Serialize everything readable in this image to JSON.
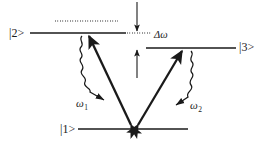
{
  "figure": {
    "kind": "energy-level-diagram",
    "width": 276,
    "height": 142,
    "background_color": "#ffffff",
    "ink_color": "#1a1a1a"
  },
  "levels": [
    {
      "id": "level-2",
      "label": "|2>",
      "label_position": "left",
      "line": {
        "x1": 30,
        "y1": 33,
        "x2": 126,
        "y2": 33
      }
    },
    {
      "id": "level-3",
      "label": "|3>",
      "label_position": "right",
      "line": {
        "x1": 146,
        "y1": 48,
        "x2": 236,
        "y2": 48
      }
    },
    {
      "id": "level-1",
      "label": "|1>",
      "label_position": "left",
      "line": {
        "x1": 78,
        "y1": 129,
        "x2": 188,
        "y2": 129
      }
    }
  ],
  "dotted_lines": [
    {
      "id": "dotted-above-level-2",
      "x1": 55,
      "y1": 21,
      "x2": 118,
      "y2": 21
    },
    {
      "id": "dotted-at-level-2",
      "x1": 128,
      "y1": 33,
      "x2": 152,
      "y2": 33
    }
  ],
  "detuning": {
    "id": "detuning-bracket",
    "label": "Δω",
    "top_arrow": {
      "x": 137,
      "y_from": 2,
      "y_to": 33
    },
    "bottom_arrow": {
      "x": 137,
      "y_from": 78,
      "y_to": 48
    }
  },
  "transitions": [
    {
      "id": "pump-1",
      "style": "straight-arrow",
      "from": {
        "x": 131,
        "y": 126
      },
      "to": {
        "x": 89,
        "y": 36
      },
      "direction": "upward",
      "double_headed": true
    },
    {
      "id": "pump-2",
      "style": "straight-arrow",
      "from": {
        "x": 137,
        "y": 126
      },
      "to": {
        "x": 182,
        "y": 51
      },
      "direction": "upward",
      "double_headed": true
    },
    {
      "id": "emission-1",
      "style": "wavy-arrow",
      "label": "ω",
      "subscript": "1",
      "from": {
        "x": 83,
        "y": 37
      },
      "to": {
        "x": 110,
        "y": 94
      }
    },
    {
      "id": "emission-2",
      "style": "wavy-arrow",
      "label": "ω",
      "subscript": "2",
      "from": {
        "x": 190,
        "y": 52
      },
      "to": {
        "x": 172,
        "y": 106
      }
    }
  ],
  "labels": {
    "state_2": "|2>",
    "state_3": "|3>",
    "state_1": "|1>",
    "omega_1": "ω",
    "omega_1_sub": "1",
    "omega_2": "ω",
    "omega_2_sub": "2",
    "delta_omega": "Δω"
  }
}
